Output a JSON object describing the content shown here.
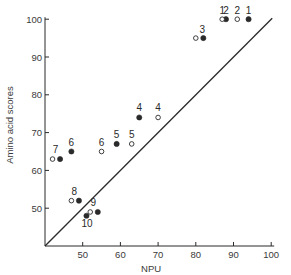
{
  "chart_data": {
    "type": "scatter",
    "title": "",
    "xlabel": "NPU",
    "ylabel": "Amino acid scores",
    "xlim": [
      40,
      100
    ],
    "ylim": [
      40,
      100
    ],
    "xticks": [
      50,
      60,
      70,
      80,
      90,
      100
    ],
    "yticks": [
      50,
      60,
      70,
      80,
      90,
      100
    ],
    "grid": false,
    "legend": "none",
    "reference_line": {
      "type": "identity",
      "label": "y = x",
      "from": [
        40,
        40
      ],
      "to": [
        100,
        100
      ]
    },
    "series": [
      {
        "name": "filled",
        "marker": "filled-circle",
        "points": [
          {
            "label": "1",
            "x": 94,
            "y": 100
          },
          {
            "label": "2",
            "x": 88,
            "y": 100
          },
          {
            "label": "3",
            "x": 82,
            "y": 95
          },
          {
            "label": "4",
            "x": 65,
            "y": 74
          },
          {
            "label": "5",
            "x": 59,
            "y": 67
          },
          {
            "label": "6",
            "x": 47,
            "y": 65
          },
          {
            "label": "7",
            "x": 44,
            "y": 63
          },
          {
            "label": "8",
            "x": 49,
            "y": 52
          },
          {
            "label": "9",
            "x": 54,
            "y": 49
          },
          {
            "label": "10",
            "x": 51,
            "y": 48
          }
        ]
      },
      {
        "name": "open",
        "marker": "open-circle",
        "points": [
          {
            "label": "1",
            "x": 87,
            "y": 100
          },
          {
            "label": "2",
            "x": 91,
            "y": 100
          },
          {
            "label": "3",
            "x": 80,
            "y": 95
          },
          {
            "label": "4",
            "x": 70,
            "y": 74
          },
          {
            "label": "5",
            "x": 63,
            "y": 67
          },
          {
            "label": "6",
            "x": 55,
            "y": 65
          },
          {
            "label": "7",
            "x": 42,
            "y": 63
          },
          {
            "label": "8",
            "x": 47,
            "y": 52
          },
          {
            "label": "9",
            "x": 52,
            "y": 49
          }
        ]
      }
    ]
  },
  "layout": {
    "origin_px": [
      45,
      246
    ],
    "x_px_per_unit": 3.77,
    "y_px_per_unit": 3.78,
    "ink_color": "#2a2a2a"
  }
}
